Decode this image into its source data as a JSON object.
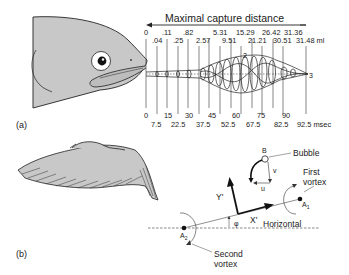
{
  "figure": {
    "panel_a": {
      "label": "(a)",
      "title": "Maximal capture distance",
      "volume_unit": "ml",
      "time_unit": "msec",
      "volume_row1": [
        "0",
        ".11",
        ".82",
        "5.31",
        "15.29",
        "26.42",
        "31.36"
      ],
      "volume_row2": [
        ".04",
        ".25",
        "2.57",
        "9.51",
        "21.21",
        "30.51",
        "31.48 ml"
      ],
      "time_row1": [
        "0",
        "15",
        "30",
        "45",
        "60",
        "75",
        "90"
      ],
      "time_row2": [
        "7.5",
        "22.5",
        "37.5",
        "52.5",
        "67.5",
        "82.5",
        "92.5 msec"
      ],
      "wave_markers": [
        "2",
        "3"
      ],
      "subject": "fish-head-icon"
    },
    "panel_b": {
      "label": "(b)",
      "subject": "bird-wing-icon",
      "bubble_label": "Bubble",
      "bubble_point": "B",
      "velocity_v": "v",
      "velocity_u": "u",
      "first_vortex_line1": "First",
      "first_vortex_line2": "vortex",
      "second_vortex_line1": "Second",
      "second_vortex_line2": "vortex",
      "horizontal_label": "Horizontal",
      "axis_x": "X'",
      "axis_y": "Y'",
      "angle": "φ",
      "point_a1": "A",
      "point_a1_sub": "1",
      "point_a2": "A",
      "point_a2_sub": "2"
    },
    "colors": {
      "fill_gray": "#c8c8c8",
      "ink": "#1a1a1a"
    }
  }
}
